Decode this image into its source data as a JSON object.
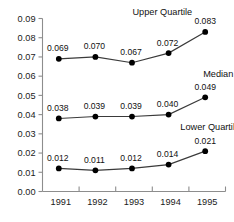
{
  "chart_data": {
    "type": "line",
    "title": "",
    "subtitle": "",
    "xlabel": "",
    "ylabel": "",
    "grid": false,
    "legend_position": "inline-right",
    "categories": [
      "1991",
      "1992",
      "1993",
      "1994",
      "1995"
    ],
    "x": [
      1991,
      1992,
      1993,
      1994,
      1995
    ],
    "ylim": [
      0.0,
      0.09
    ],
    "ytick_labels": [
      "0.00",
      "0.01",
      "0.02",
      "0.03",
      "0.04",
      "0.05",
      "0.06",
      "0.07",
      "0.08",
      "0.09"
    ],
    "ytick_values": [
      0.0,
      0.01,
      0.02,
      0.03,
      0.04,
      0.05,
      0.06,
      0.07,
      0.08,
      0.09
    ],
    "series": [
      {
        "name": "Upper Quartile",
        "values": [
          0.069,
          0.07,
          0.067,
          0.072,
          0.083
        ],
        "value_labels": [
          "0.069",
          "0.070",
          "0.067",
          "0.072",
          "0.083"
        ],
        "color": "#3a3a3a",
        "marker": "filled-circle"
      },
      {
        "name": "Median",
        "values": [
          0.038,
          0.039,
          0.039,
          0.04,
          0.049
        ],
        "value_labels": [
          "0.038",
          "0.039",
          "0.039",
          "0.040",
          "0.049"
        ],
        "color": "#3a3a3a",
        "marker": "filled-circle"
      },
      {
        "name": "Lower Quartile",
        "values": [
          0.012,
          0.011,
          0.012,
          0.014,
          0.021
        ],
        "value_labels": [
          "0.012",
          "0.011",
          "0.012",
          "0.014",
          "0.021"
        ],
        "color": "#3a3a3a",
        "marker": "filled-circle"
      }
    ],
    "annotations": [
      {
        "text": "Upper Quartile",
        "series": "Upper Quartile"
      },
      {
        "text": "Median",
        "series": "Median"
      },
      {
        "text": "Lower Quartile",
        "series": "Lower Quartile"
      }
    ]
  },
  "axes": {
    "y_axis_name": "value-axis",
    "x_axis_name": "year-axis"
  },
  "colors": {
    "axis": "#8d8d8d",
    "line": "#3a3a3a",
    "marker": "#000000",
    "text": "#111111",
    "background": "#ffffff"
  }
}
